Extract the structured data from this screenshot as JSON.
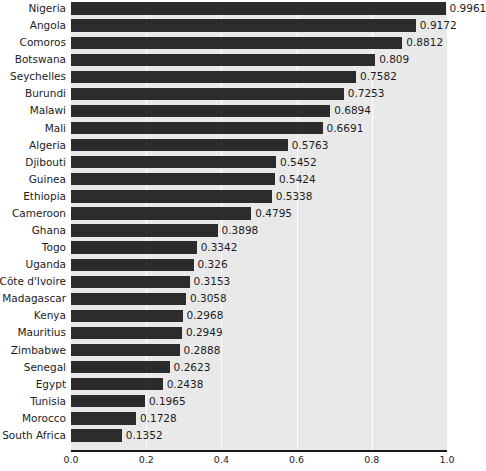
{
  "chart_data": {
    "type": "bar",
    "orientation": "horizontal",
    "title": "",
    "subtitle": "",
    "xlabel": "",
    "ylabel": "",
    "xlim": [
      0.0,
      1.0
    ],
    "xticks": [
      0.0,
      0.2,
      0.4,
      0.6,
      0.8,
      1.0
    ],
    "xtick_labels": [
      "0.0",
      "0.2",
      "0.4",
      "0.6",
      "0.8",
      "1.0"
    ],
    "grid": "vertical-white-gridlines",
    "legend": "none",
    "bar_color": "#2c2c2c",
    "panel_color": "#e9e9e9",
    "gridline_color": "#ffffff",
    "axis_color": "#1a1a1a",
    "text_color": "#1c1c1c",
    "categories": [
      "Nigeria",
      "Angola",
      "Comoros",
      "Botswana",
      "Seychelles",
      "Burundi",
      "Malawi",
      "Mali",
      "Algeria",
      "Djibouti",
      "Guinea",
      "Ethiopia",
      "Cameroon",
      "Ghana",
      "Togo",
      "Uganda",
      "Côte d'Ivoire",
      "Madagascar",
      "Kenya",
      "Mauritius",
      "Zimbabwe",
      "Senegal",
      "Egypt",
      "Tunisia",
      "Morocco",
      "South Africa"
    ],
    "values": [
      0.9961,
      0.9172,
      0.8812,
      0.809,
      0.7582,
      0.7253,
      0.6894,
      0.6691,
      0.5763,
      0.5452,
      0.5424,
      0.5338,
      0.4795,
      0.3898,
      0.3342,
      0.326,
      0.3153,
      0.3058,
      0.2968,
      0.2949,
      0.2888,
      0.2623,
      0.2438,
      0.1965,
      0.1728,
      0.1352
    ],
    "value_labels": [
      "0.9961",
      "0.9172",
      "0.8812",
      "0.809",
      "0.7582",
      "0.7253",
      "0.6894",
      "0.6691",
      "0.5763",
      "0.5452",
      "0.5424",
      "0.5338",
      "0.4795",
      "0.3898",
      "0.3342",
      "0.326",
      "0.3153",
      "0.3058",
      "0.2968",
      "0.2949",
      "0.2888",
      "0.2623",
      "0.2438",
      "0.1965",
      "0.1728",
      "0.1352"
    ]
  }
}
